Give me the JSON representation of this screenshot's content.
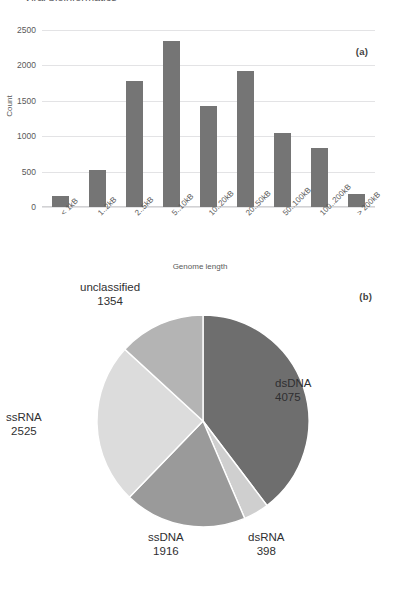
{
  "heading": {
    "text": "Viral bioinformatics"
  },
  "panels": {
    "a_label": "(a)",
    "b_label": "(b)"
  },
  "chart_data": [
    {
      "type": "bar",
      "panel": "(a)",
      "title": "",
      "xlabel": "Genome length",
      "ylabel": "Count",
      "categories": [
        "< 1kB",
        "1..2kB",
        "2..5kB",
        "5..10kB",
        "10..20kB",
        "20..50kB",
        "50..100kB",
        "100..200kB",
        "> 200kB"
      ],
      "values": [
        150,
        520,
        1780,
        2350,
        1430,
        1920,
        1040,
        840,
        190
      ],
      "yticks": [
        0,
        500,
        1000,
        1500,
        2000,
        2500
      ],
      "ylim": [
        0,
        2500
      ],
      "grid": true,
      "legend": "none",
      "bar_color": "#757575"
    },
    {
      "type": "pie",
      "panel": "(b)",
      "title": "",
      "labels": [
        "dsDNA",
        "dsRNA",
        "ssDNA",
        "ssRNA",
        "unclassified"
      ],
      "values": [
        4075,
        398,
        1916,
        2525,
        1354
      ],
      "total": 10268,
      "colors": [
        "#6e6e6e",
        "#cfcfcf",
        "#9a9a9a",
        "#dcdcdc",
        "#b4b4b4"
      ],
      "start_angle_deg": 0,
      "direction": "clockwise",
      "legend": "labels-outside"
    }
  ],
  "bar_chart": {
    "ylabel": "Count",
    "xlabel": "Genome length",
    "yticks": [
      "2500",
      "2000",
      "1500",
      "1000",
      "500",
      "0"
    ],
    "bars": [
      {
        "label": "< 1kB",
        "value": 150
      },
      {
        "label": "1..2kB",
        "value": 520
      },
      {
        "label": "2..5kB",
        "value": 1780
      },
      {
        "label": "5..10kB",
        "value": 2350
      },
      {
        "label": "10..20kB",
        "value": 1430
      },
      {
        "label": "20..50kB",
        "value": 1920
      },
      {
        "label": "50..100kB",
        "value": 1040
      },
      {
        "label": "100..200kB",
        "value": 840
      },
      {
        "label": "> 200kB",
        "value": 190
      }
    ]
  },
  "pie_chart": {
    "slices": [
      {
        "label": "dsDNA",
        "value": "4075"
      },
      {
        "label": "dsRNA",
        "value": "398"
      },
      {
        "label": "ssDNA",
        "value": "1916"
      },
      {
        "label": "ssRNA",
        "value": "2525"
      },
      {
        "label": "unclassified",
        "value": "1354"
      }
    ]
  }
}
